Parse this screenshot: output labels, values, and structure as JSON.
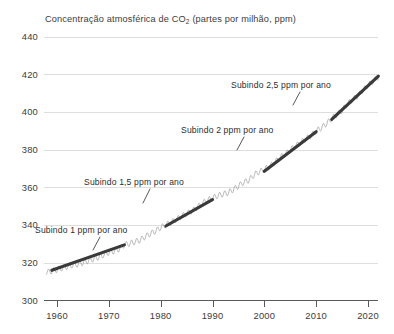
{
  "chart_data": {
    "type": "line",
    "title": "Concentração atmosférica de CO2 (partes por milhão, ppm)",
    "title_main_pre": "Concentração atmosférica de CO",
    "title_sub": "2",
    "title_main_post": " (partes por milhão, ppm)",
    "xlabel": "",
    "ylabel": "",
    "xlim": [
      1957,
      2024
    ],
    "ylim": [
      300,
      440
    ],
    "grid": true,
    "legend": "none",
    "y_ticks": [
      300,
      320,
      340,
      360,
      380,
      400,
      420,
      440
    ],
    "y_tick_labels": [
      "300",
      "320",
      "340",
      "360",
      "380",
      "400",
      "420",
      "440"
    ],
    "x_ticks": [
      1960,
      1970,
      1980,
      1990,
      2000,
      2010,
      2020
    ],
    "x_tick_labels": [
      "1960",
      "1970",
      "1980",
      "1990",
      "2000",
      "2010",
      "2020"
    ],
    "series": [
      {
        "name": "CO2 mensal (com ciclo sazonal)",
        "color": "#8e8e8e",
        "seasonal_amplitude_ppm": 3.0,
        "x": [
          1958,
          1959,
          1960,
          1961,
          1962,
          1963,
          1964,
          1965,
          1966,
          1967,
          1968,
          1969,
          1970,
          1971,
          1972,
          1973,
          1974,
          1975,
          1976,
          1977,
          1978,
          1979,
          1980,
          1981,
          1982,
          1983,
          1984,
          1985,
          1986,
          1987,
          1988,
          1989,
          1990,
          1991,
          1992,
          1993,
          1994,
          1995,
          1996,
          1997,
          1998,
          1999,
          2000,
          2001,
          2002,
          2003,
          2004,
          2005,
          2006,
          2007,
          2008,
          2009,
          2010,
          2011,
          2012,
          2013,
          2014,
          2015,
          2016,
          2017,
          2018,
          2019,
          2020,
          2021,
          2022
        ],
        "values": [
          315.0,
          315.6,
          316.4,
          317.2,
          318.0,
          318.8,
          319.2,
          320.0,
          321.0,
          322.0,
          322.9,
          324.2,
          325.5,
          326.2,
          327.3,
          329.6,
          330.2,
          331.1,
          332.0,
          333.8,
          335.4,
          336.8,
          338.7,
          340.1,
          341.4,
          343.0,
          344.6,
          346.0,
          347.4,
          349.2,
          351.6,
          353.1,
          354.4,
          355.6,
          356.4,
          357.1,
          358.8,
          360.8,
          362.6,
          363.8,
          366.6,
          368.3,
          369.5,
          371.0,
          373.2,
          375.8,
          377.5,
          379.8,
          381.9,
          383.8,
          385.6,
          387.4,
          389.9,
          391.6,
          393.8,
          396.5,
          398.6,
          400.8,
          404.2,
          406.5,
          408.5,
          411.4,
          414.2,
          416.4,
          418.6
        ]
      }
    ],
    "trend_segments": [
      {
        "name": "Subindo 1 ppm por ano",
        "label": "Subindo 1 ppm por ano",
        "rate_ppm_per_year": 1.0,
        "x_start": 1959,
        "x_end": 1973,
        "y_start": 316.0,
        "y_end": 329.5
      },
      {
        "name": "Subindo 1,5 ppm por ano",
        "label": "Subindo 1,5 ppm por ano",
        "rate_ppm_per_year": 1.5,
        "x_start": 1981,
        "x_end": 1990,
        "y_start": 339.5,
        "y_end": 353.5
      },
      {
        "name": "Subindo 2 ppm por ano",
        "label": "Subindo 2 ppm por ano",
        "rate_ppm_per_year": 2.0,
        "x_start": 2000,
        "x_end": 2010,
        "y_start": 368.5,
        "y_end": 389.5
      },
      {
        "name": "Subindo 2,5 ppm por ano",
        "label": "Subindo 2,5 ppm por ano",
        "rate_ppm_per_year": 2.5,
        "x_start": 2013,
        "x_end": 2022,
        "y_start": 396.0,
        "y_end": 419.0
      }
    ],
    "annotations": [
      {
        "name": "annotation-1ppm",
        "text": "Subindo 1 ppm por ano",
        "text_x": 35,
        "text_y": 233,
        "leader": [
          [
            100,
            237
          ],
          [
            93,
            250
          ]
        ]
      },
      {
        "name": "annotation-1-5ppm",
        "text": "Subindo 1,5 ppm por ano",
        "text_x": 84,
        "text_y": 185,
        "leader": [
          [
            150,
            189
          ],
          [
            143,
            203
          ]
        ]
      },
      {
        "name": "annotation-2ppm",
        "text": "Subindo 2 ppm por ano",
        "text_x": 181,
        "text_y": 133,
        "leader": [
          [
            244,
            137
          ],
          [
            237,
            150
          ]
        ]
      },
      {
        "name": "annotation-2-5ppm",
        "text": "Subindo 2,5 ppm por ano",
        "text_x": 231,
        "text_y": 88,
        "leader": [
          [
            300,
            92
          ],
          [
            293,
            105
          ]
        ]
      }
    ],
    "colors": {
      "background": "#ffffff",
      "gridline": "#dedede",
      "axis": "#5a5a5a",
      "seasonal_line": "#8e8e8e",
      "trend_line": "#3a3a3a",
      "text": "#3b3b3b"
    }
  }
}
